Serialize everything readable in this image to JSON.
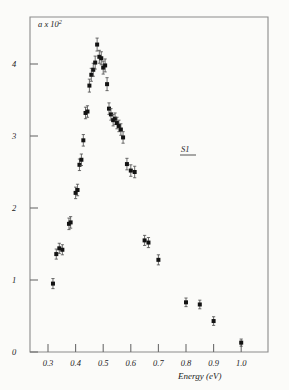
{
  "figure": {
    "background_color": "#fbfbf9",
    "ink_color": "#131313",
    "axis_color": "#8b8b8b"
  },
  "axes": {
    "y_label": "a x 10",
    "y_label_exponent": "2",
    "x_title": "Energy  (eV)",
    "x_ticks": [
      "0.3",
      "0.4",
      "0.5",
      "0.6",
      "0.7",
      "0.8",
      "0.9",
      "1.0"
    ],
    "y_ticks": [
      "0",
      "1",
      "2",
      "3",
      "4"
    ]
  },
  "annotation": {
    "label": "S1"
  },
  "chart_data": {
    "type": "scatter",
    "title": "",
    "xlabel": "Energy (eV)",
    "ylabel": "a x 10^2",
    "xlim": [
      0.26,
      1.06
    ],
    "ylim": [
      0.0,
      4.65
    ],
    "grid": false,
    "legend": "none",
    "annotations": [
      {
        "text": "S1",
        "x": 0.74,
        "y": 2.62,
        "underlined": true
      }
    ],
    "series": [
      {
        "name": "absorption coefficient",
        "marker": "filled-square",
        "error_bars": "vertical",
        "x": [
          0.318,
          0.33,
          0.341,
          0.352,
          0.376,
          0.382,
          0.4,
          0.407,
          0.414,
          0.421,
          0.428,
          0.436,
          0.443,
          0.45,
          0.457,
          0.464,
          0.471,
          0.478,
          0.486,
          0.493,
          0.5,
          0.507,
          0.514,
          0.521,
          0.528,
          0.536,
          0.543,
          0.55,
          0.557,
          0.564,
          0.572,
          0.586,
          0.6,
          0.614,
          0.65,
          0.664,
          0.7,
          0.8,
          0.85,
          0.9,
          1.0
        ],
        "y": [
          0.95,
          1.36,
          1.44,
          1.42,
          1.78,
          1.8,
          2.21,
          2.25,
          2.6,
          2.67,
          2.94,
          3.32,
          3.34,
          3.7,
          3.85,
          3.92,
          4.02,
          4.27,
          4.1,
          4.08,
          3.95,
          3.98,
          3.72,
          3.38,
          3.3,
          3.22,
          3.24,
          3.18,
          3.14,
          3.09,
          2.98,
          2.61,
          2.52,
          2.5,
          1.55,
          1.52,
          1.28,
          0.69,
          0.66,
          0.43,
          0.13
        ],
        "yerr": [
          0.07,
          0.07,
          0.07,
          0.07,
          0.08,
          0.08,
          0.08,
          0.08,
          0.08,
          0.08,
          0.08,
          0.08,
          0.08,
          0.09,
          0.09,
          0.09,
          0.09,
          0.09,
          0.09,
          0.09,
          0.09,
          0.09,
          0.09,
          0.08,
          0.08,
          0.08,
          0.08,
          0.08,
          0.08,
          0.08,
          0.08,
          0.08,
          0.08,
          0.08,
          0.07,
          0.07,
          0.07,
          0.06,
          0.06,
          0.06,
          0.05
        ]
      }
    ]
  }
}
